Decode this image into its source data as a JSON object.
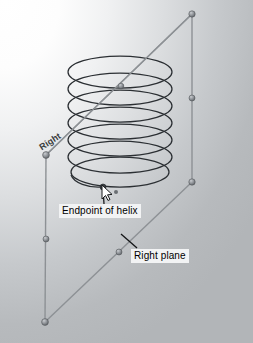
{
  "viewport": {
    "kind": "cad-3d-viewport",
    "background_top_left": "#ffffff",
    "background_bottom_right": "#b2b5b8"
  },
  "plane": {
    "name_label": "Right",
    "edge_color": "#8d9195",
    "vertex_color": "#7e8286",
    "corners": [
      {
        "name": "top-right",
        "x": 192,
        "y": 14
      },
      {
        "name": "top-left",
        "x": 46,
        "y": 155
      },
      {
        "name": "bottom-left",
        "x": 45,
        "y": 322
      },
      {
        "name": "bottom-right",
        "x": 192,
        "y": 182
      }
    ],
    "midpoints": [
      {
        "name": "right-edge-midpoint",
        "x": 192,
        "y": 98
      },
      {
        "name": "left-edge-midpoint",
        "x": 46,
        "y": 239
      },
      {
        "name": "bottom-edge-midpoint",
        "x": 119,
        "y": 252
      }
    ]
  },
  "helix": {
    "color": "#2b2f33",
    "turns": 7,
    "center_x": 120,
    "top_y": 72,
    "bottom_y": 176,
    "radius_x": 52,
    "radius_y": 16,
    "endpoint": {
      "x": 103,
      "y": 186
    },
    "top_vertex": {
      "x": 121,
      "y": 86
    }
  },
  "annotations": {
    "endpoint": {
      "text": "Endpoint of helix",
      "leader_from": {
        "x": 104,
        "y": 203
      },
      "leader_to": {
        "x": 103,
        "y": 187
      }
    },
    "right_plane": {
      "text": "Right plane",
      "leader_from": {
        "x": 137,
        "y": 247
      },
      "leader_to": {
        "x": 121,
        "y": 234
      }
    }
  },
  "cursor": {
    "name": "mouse-pointer",
    "x": 103,
    "y": 187
  },
  "extra_point": {
    "x": 116,
    "y": 192
  }
}
